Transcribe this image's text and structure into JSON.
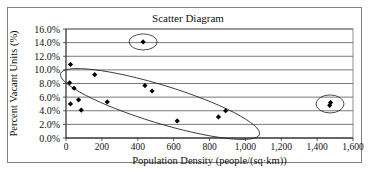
{
  "chart_data": {
    "type": "scatter",
    "title": "Scatter Diagram",
    "xlabel": "Population Density (people/(sq·km))",
    "ylabel": "Percent Vacant Units (%)",
    "xlim": [
      0,
      1600
    ],
    "ylim": [
      0,
      16
    ],
    "x_ticks": [
      "0",
      "200",
      "400",
      "600",
      "800",
      "1,000",
      "1,200",
      "1,400",
      "1,600"
    ],
    "y_ticks": [
      "0.0%",
      "2.0%",
      "4.0%",
      "6.0%",
      "8.0%",
      "10.0%",
      "12.0%",
      "14.0%",
      "16.0%"
    ],
    "grid": "horizontal",
    "legend": "none",
    "points": [
      {
        "x": 25,
        "y": 10.8
      },
      {
        "x": 20,
        "y": 8.1
      },
      {
        "x": 45,
        "y": 7.3
      },
      {
        "x": 25,
        "y": 5.0
      },
      {
        "x": 70,
        "y": 5.6
      },
      {
        "x": 85,
        "y": 4.1
      },
      {
        "x": 160,
        "y": 9.3
      },
      {
        "x": 230,
        "y": 5.3
      },
      {
        "x": 430,
        "y": 14.1
      },
      {
        "x": 440,
        "y": 7.7
      },
      {
        "x": 480,
        "y": 6.9
      },
      {
        "x": 620,
        "y": 2.5
      },
      {
        "x": 850,
        "y": 3.1
      },
      {
        "x": 890,
        "y": 4.0
      },
      {
        "x": 1470,
        "y": 4.8
      },
      {
        "x": 1475,
        "y": 5.2
      }
    ],
    "annotations": [
      {
        "type": "ellipse",
        "label": "outlier-high",
        "cx": 430,
        "cy": 14.1
      },
      {
        "type": "ellipse",
        "label": "main-cluster-trend"
      },
      {
        "type": "ellipse",
        "label": "outlier-right",
        "cx": 1472,
        "cy": 5.0
      }
    ]
  },
  "colors": {
    "marker": "#000000",
    "grid": "#555555",
    "frame": "#808080"
  }
}
